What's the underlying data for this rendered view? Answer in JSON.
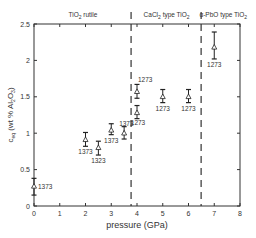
{
  "chart_data": {
    "type": "scatter",
    "title": "",
    "xlabel": "pressure (GPa)",
    "ylabel": "c_eq (wt % Al2O3)",
    "ylabel_parts": {
      "c": "c",
      "sub": "eq",
      "rest": "(wt % Al",
      "sub2": "2",
      "mid": "O",
      "sub3": "3",
      "end": ")"
    },
    "xlim": [
      0,
      8
    ],
    "ylim": [
      0,
      2.5
    ],
    "xticks": [
      0,
      1,
      2,
      3,
      4,
      5,
      6,
      7,
      8
    ],
    "yticks": [
      0,
      0.5,
      1,
      1.5,
      2,
      2.5
    ],
    "ytick_labels": [
      "0",
      "0.5",
      "1",
      "1.5",
      "2",
      "2.5"
    ],
    "grid": false,
    "phase_boundaries": [
      3.77,
      6.49
    ],
    "phase_labels": [
      {
        "text": "TiO",
        "sub": "2",
        "rest": " rutile",
        "x": 1.9
      },
      {
        "text": "CaCl",
        "sub": "2",
        "rest": " type TiO",
        "sub2": "2",
        "x": 5.15
      },
      {
        "text": "α-PbO type TiO",
        "sub": "2",
        "rest": "",
        "x": 7.35
      }
    ],
    "series": [
      {
        "name": "equilibrium Al2O3 content",
        "marker": "open-triangle",
        "points": [
          {
            "x": 0.0,
            "y": 0.27,
            "err_lo": 0.15,
            "err_hi": 0.38,
            "label": "1373",
            "label_pos": "right"
          },
          {
            "x": 2.0,
            "y": 0.91,
            "err_lo": 0.82,
            "err_hi": 1.01,
            "label": "1373",
            "label_pos": "below"
          },
          {
            "x": 2.5,
            "y": 0.8,
            "err_lo": 0.7,
            "err_hi": 0.89,
            "label": "1323",
            "label_pos": "below"
          },
          {
            "x": 3.0,
            "y": 1.04,
            "err_lo": 0.98,
            "err_hi": 1.13,
            "label": "1373",
            "label_pos": "below"
          },
          {
            "x": 3.5,
            "y": 1.0,
            "err_lo": 0.92,
            "err_hi": 1.09,
            "label": "1373",
            "label_pos": "above"
          },
          {
            "x": 4.0,
            "y": 1.28,
            "err_lo": 1.2,
            "err_hi": 1.38,
            "label": "1273",
            "label_pos": "below"
          },
          {
            "x": 4.0,
            "y": 1.57,
            "err_lo": 1.48,
            "err_hi": 1.67,
            "label": "1273",
            "label_pos": "above"
          },
          {
            "x": 5.0,
            "y": 1.5,
            "err_lo": 1.42,
            "err_hi": 1.6,
            "label": "1273",
            "label_pos": "below"
          },
          {
            "x": 6.0,
            "y": 1.5,
            "err_lo": 1.42,
            "err_hi": 1.6,
            "label": "1273",
            "label_pos": "below"
          },
          {
            "x": 7.0,
            "y": 2.18,
            "err_lo": 2.02,
            "err_hi": 2.39,
            "label": "1273",
            "label_pos": "below"
          }
        ]
      }
    ]
  }
}
